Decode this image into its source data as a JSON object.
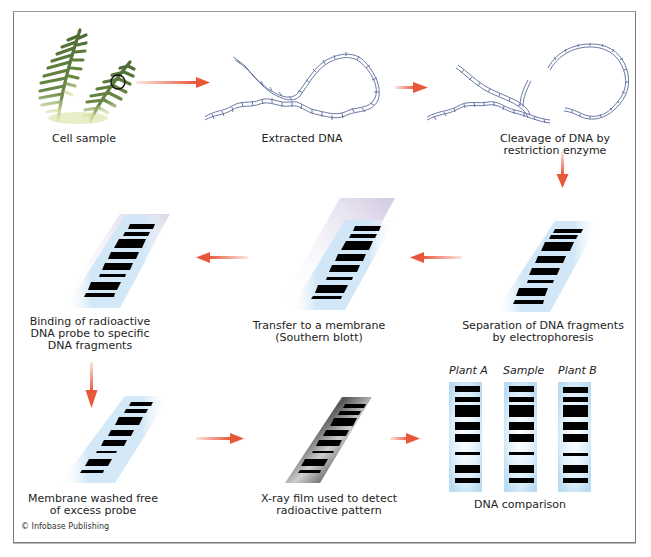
{
  "diagram": {
    "steps": [
      {
        "id": "cell-sample",
        "label": "Cell sample"
      },
      {
        "id": "extracted-dna",
        "label": "Extracted DNA"
      },
      {
        "id": "cleavage",
        "label_line1": "Cleavage of DNA by",
        "label_line2": "restriction enzyme"
      },
      {
        "id": "electrophoresis",
        "label_line1": "Separation of DNA fragments",
        "label_line2": "by electrophoresis"
      },
      {
        "id": "transfer",
        "label_line1": "Transfer to a membrane",
        "label_line2": "(Southern blott)"
      },
      {
        "id": "probe-binding",
        "label_line1": "Binding of radioactive",
        "label_line2": "DNA probe to specific",
        "label_line3": "DNA fragments"
      },
      {
        "id": "membrane-washed",
        "label_line1": "Membrane washed free",
        "label_line2": "of excess probe"
      },
      {
        "id": "xray-film",
        "label_line1": "X-ray film used to detect",
        "label_line2": "radioactive pattern"
      },
      {
        "id": "dna-comparison",
        "label": "DNA comparison"
      }
    ],
    "lanes": [
      {
        "name": "Plant A"
      },
      {
        "name": "Sample"
      },
      {
        "name": "Plant B"
      }
    ],
    "credit": "© Infobase Publishing",
    "colors": {
      "arrow": "#e8573a",
      "dna_strand": "#5a6a9a",
      "fern": "#5c7a3a",
      "membrane": "#cfe6f7",
      "gel_band": "#000000",
      "frame": "#7a7a7a"
    }
  }
}
